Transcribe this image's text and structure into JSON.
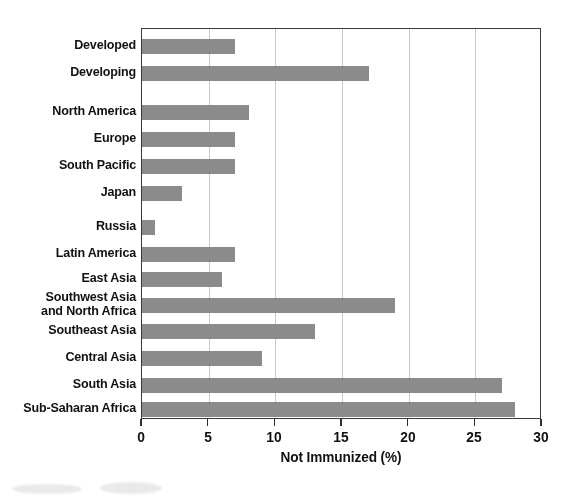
{
  "chart_data": {
    "type": "bar",
    "orientation": "horizontal",
    "title": "",
    "xlabel": "Not Immunized  (%)",
    "ylabel": "",
    "xlim": [
      0,
      30
    ],
    "xticks": [
      0,
      5,
      10,
      15,
      20,
      25,
      30
    ],
    "xtick_labels": [
      "0",
      "5",
      "10",
      "15",
      "20",
      "25",
      "30"
    ],
    "grid": "vertical",
    "legend": "none",
    "bar_color": "#8b8b8b",
    "axis_color": "#3a3a3a",
    "gridline_color": "#c9c9c9",
    "categories": [
      "Developed",
      "Developing",
      "North America",
      "Europe",
      "South Pacific",
      "Japan",
      "Russia",
      "Latin America",
      "East Asia",
      "Southwest Asia\nand North Africa",
      "Southeast Asia",
      "Central Asia",
      "South Asia",
      "Sub-Saharan Africa"
    ],
    "values": [
      7,
      17,
      8,
      7,
      7,
      3,
      1,
      7,
      6,
      19,
      13,
      9,
      27,
      28
    ],
    "rows": [
      {
        "label": "Developed",
        "value": 7,
        "top": 38,
        "group": 1
      },
      {
        "label": "Developing",
        "value": 17,
        "top": 65,
        "group": 1
      },
      {
        "label": "North America",
        "value": 8,
        "top": 104,
        "group": 2
      },
      {
        "label": "Europe",
        "value": 7,
        "top": 131,
        "group": 2
      },
      {
        "label": "South Pacific",
        "value": 7,
        "top": 158,
        "group": 2
      },
      {
        "label": "Japan",
        "value": 3,
        "top": 185,
        "group": 2
      },
      {
        "label": "Russia",
        "value": 1,
        "top": 219,
        "group": 3
      },
      {
        "label": "Latin America",
        "value": 7,
        "top": 246,
        "group": 3
      },
      {
        "label": "East Asia",
        "value": 6,
        "top": 271,
        "group": 3
      },
      {
        "label": "Southwest Asia\nand North Africa",
        "value": 19,
        "top": 297,
        "group": 3
      },
      {
        "label": "Southeast Asia",
        "value": 13,
        "top": 323,
        "group": 3
      },
      {
        "label": "Central Asia",
        "value": 9,
        "top": 350,
        "group": 3
      },
      {
        "label": "South Asia",
        "value": 27,
        "top": 377,
        "group": 3
      },
      {
        "label": "Sub-Saharan Africa",
        "value": 28,
        "top": 401,
        "group": 3
      }
    ]
  },
  "axis": {
    "x_title": "Not Immunized  (%)",
    "ticks": [
      "0",
      "5",
      "10",
      "15",
      "20",
      "25",
      "30"
    ]
  },
  "labels": {
    "developed": "Developed",
    "developing": "Developing",
    "north_america": "North America",
    "europe": "Europe",
    "south_pacific": "South Pacific",
    "japan": "Japan",
    "russia": "Russia",
    "latin_america": "Latin America",
    "east_asia": "East Asia",
    "southwest_asia": "Southwest Asia\nand North Africa",
    "southeast_asia": "Southeast Asia",
    "central_asia": "Central Asia",
    "south_asia": "South Asia",
    "sub_saharan_africa": "Sub-Saharan Africa"
  }
}
